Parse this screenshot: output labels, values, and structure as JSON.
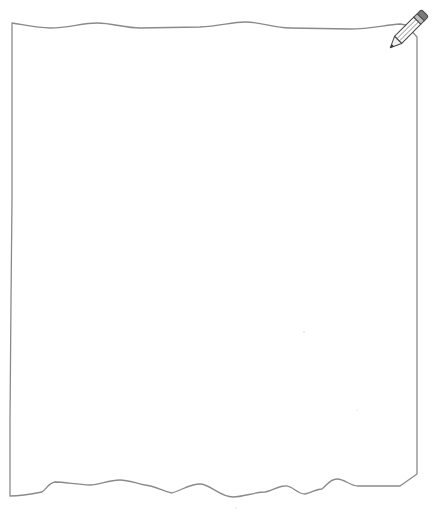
{
  "top_caption": "",
  "sheet": {
    "kind": "blank-paper-sheet",
    "outline_color": "#8a8a8a",
    "fill_color": "#ffffff",
    "edge_style": "torn-wavy"
  },
  "pencil_icon": {
    "name": "pencil-icon",
    "body_color": "#ffffff",
    "outline_color": "#555555",
    "eraser_color": "#7a7a7a",
    "tip_color": "#333333"
  }
}
